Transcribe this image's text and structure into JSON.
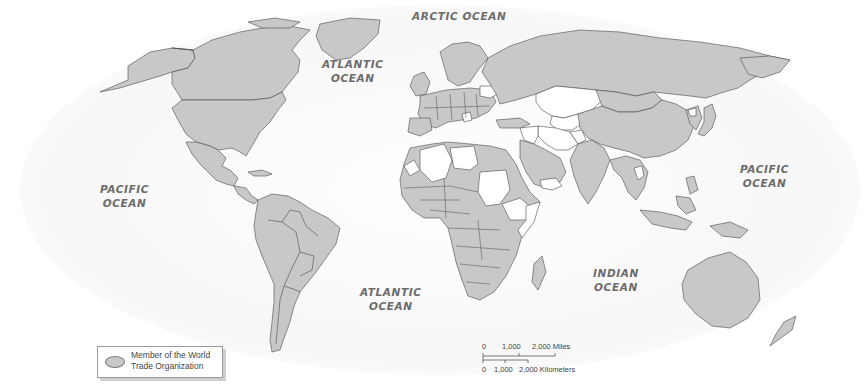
{
  "map": {
    "title": "World Trade Organization Membership",
    "fill_colors": {
      "member": "#c8c8c8",
      "non_member": "#ffffff",
      "border": "#4a4a4a",
      "label": "#6b6b6b"
    },
    "ocean_labels": [
      {
        "id": "arctic",
        "line1": "ARCTIC OCEAN",
        "line2": ""
      },
      {
        "id": "atlantic-north",
        "line1": "ATLANTIC",
        "line2": "OCEAN"
      },
      {
        "id": "pacific-west",
        "line1": "PACIFIC",
        "line2": "OCEAN"
      },
      {
        "id": "pacific-east",
        "line1": "PACIFIC",
        "line2": "OCEAN"
      },
      {
        "id": "atlantic-south",
        "line1": "ATLANTIC",
        "line2": "OCEAN"
      },
      {
        "id": "indian",
        "line1": "INDIAN",
        "line2": "OCEAN"
      }
    ],
    "legend": {
      "line1": "Member of the World",
      "line2": "Trade Organization"
    },
    "scale_bar": {
      "miles_labels": [
        "0",
        "1,000",
        "2,000 Miles"
      ],
      "km_labels": [
        "0",
        "1,000",
        "2,000 Kilometers"
      ]
    },
    "non_member_regions": [
      "Belarus",
      "Kazakhstan",
      "Uzbekistan",
      "Turkmenistan",
      "Iran",
      "Iraq",
      "Syria",
      "Lebanon",
      "Algeria",
      "Libya",
      "Sudan",
      "Ethiopia",
      "Somalia",
      "Eritrea",
      "Yemen",
      "Afghanistan",
      "Azerbaijan",
      "Serbia",
      "Bosnia",
      "North Korea",
      "Laos",
      "Western Sahara",
      "Equatorial Guinea"
    ]
  }
}
